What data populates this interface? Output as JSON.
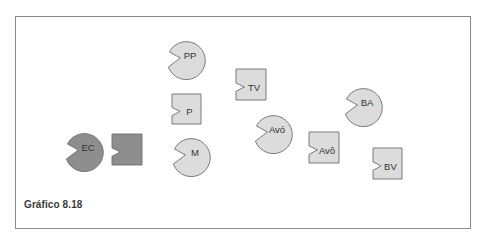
{
  "figure": {
    "caption": "Gráfico 8.18",
    "colors": {
      "light_fill": "#dcdcdc",
      "dark_fill": "#8e8e8e",
      "stroke": "#6e6e6e",
      "frame": "#8a8a8a",
      "label": "#333333"
    }
  },
  "nodes": [
    {
      "id": "ec",
      "shape": "circle-notched",
      "label": "EC",
      "cx": 85,
      "cy": 147,
      "r": 19,
      "fill": "dark"
    },
    {
      "id": "ec-square",
      "shape": "square-notched",
      "label": "",
      "x": 112,
      "y": 134,
      "w": 30,
      "h": 31,
      "fill": "dark"
    },
    {
      "id": "pp",
      "shape": "circle-notched",
      "label": "PP",
      "cx": 187,
      "cy": 55,
      "r": 19,
      "fill": "light"
    },
    {
      "id": "p",
      "shape": "square-notched",
      "label": "P",
      "x": 172,
      "y": 94,
      "w": 29,
      "h": 30,
      "fill": "light"
    },
    {
      "id": "m",
      "shape": "circle-notched",
      "label": "M",
      "cx": 192,
      "cy": 152,
      "r": 19,
      "fill": "light"
    },
    {
      "id": "tv",
      "shape": "square-notched",
      "label": "TV",
      "x": 236,
      "y": 69,
      "w": 30,
      "h": 31,
      "fill": "light"
    },
    {
      "id": "avo-circle",
      "shape": "circle-notched",
      "label": "Avó",
      "cx": 274,
      "cy": 129,
      "r": 19,
      "fill": "light"
    },
    {
      "id": "avo-square",
      "shape": "square-notched",
      "label": "Avô",
      "x": 309,
      "y": 132,
      "w": 30,
      "h": 31,
      "fill": "light"
    },
    {
      "id": "ba",
      "shape": "circle-notched",
      "label": "BA",
      "cx": 364,
      "cy": 102,
      "r": 19,
      "fill": "light"
    },
    {
      "id": "bv",
      "shape": "square-notched",
      "label": "BV",
      "x": 373,
      "y": 148,
      "w": 29,
      "h": 31,
      "fill": "light"
    }
  ]
}
